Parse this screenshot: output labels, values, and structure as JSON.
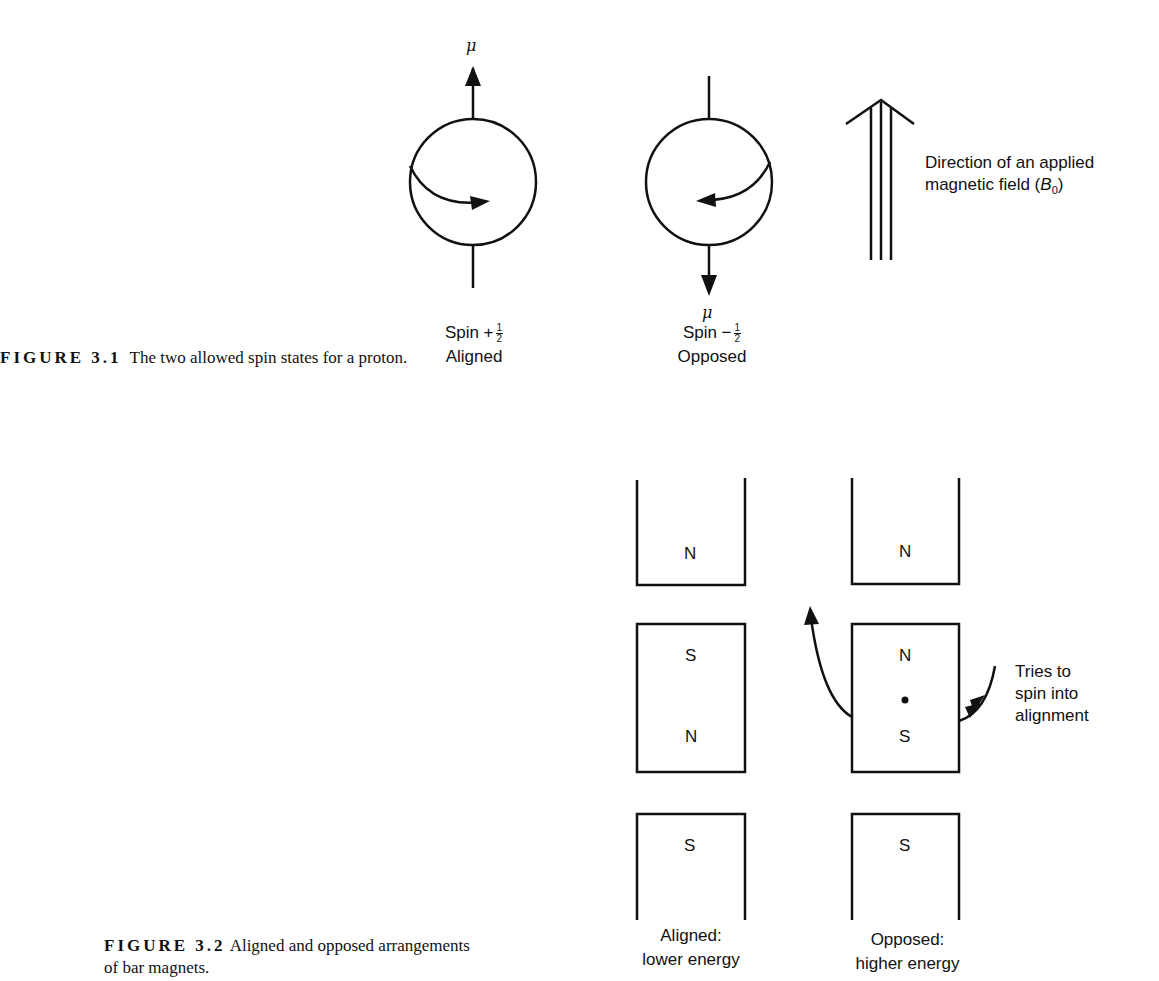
{
  "figure_3_1": {
    "caption_label": "FIGURE 3.1",
    "caption_text": "The two allowed spin states for a proton.",
    "mu_symbol": "μ",
    "states": [
      {
        "spin_prefix": "Spin +",
        "frac_num": "1",
        "frac_den": "2",
        "label": "Aligned",
        "rotation": "clockwise",
        "moment": "up"
      },
      {
        "spin_prefix": "Spin −",
        "frac_num": "1",
        "frac_den": "2",
        "label": "Opposed",
        "rotation": "counterclockwise",
        "moment": "down"
      }
    ],
    "field_label_line1": "Direction of an applied",
    "field_label_line2": "magnetic field (",
    "field_symbol": "B",
    "field_subscript": "0",
    "field_close": ")"
  },
  "figure_3_2": {
    "caption_label": "FIGURE 3.2",
    "caption_text_line1": "Aligned and opposed arrangements",
    "caption_text_line2": "of bar magnets.",
    "aligned": {
      "top_pole": "N",
      "middle_top": "S",
      "middle_bottom": "N",
      "bottom_pole": "S",
      "label_line1": "Aligned:",
      "label_line2": "lower energy"
    },
    "opposed": {
      "top_pole": "N",
      "middle_top": "N",
      "middle_bottom": "S",
      "bottom_pole": "S",
      "label_line1": "Opposed:",
      "label_line2": "higher energy"
    },
    "rotation_note": [
      "Tries to",
      "spin into",
      "alignment"
    ]
  }
}
